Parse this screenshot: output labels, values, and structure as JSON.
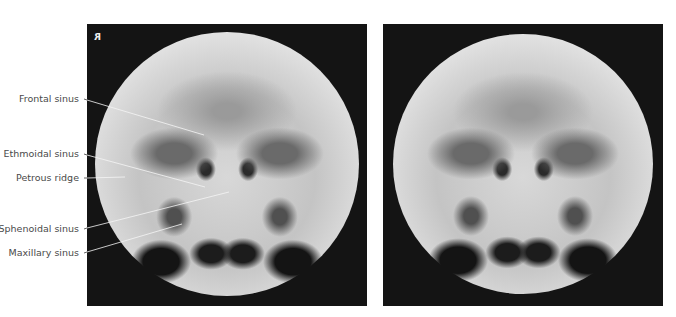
{
  "figure": {
    "left_panel": {
      "orientation_marker": "R",
      "labels": [
        {
          "id": "frontal",
          "text": "Frontal sinus"
        },
        {
          "id": "ethmoidal",
          "text": "Ethmoidal sinus"
        },
        {
          "id": "petrous",
          "text": "Petrous ridge"
        },
        {
          "id": "sphenoidal",
          "text": "Sphenoidal sinus"
        },
        {
          "id": "maxillary",
          "text": "Maxillary sinus"
        }
      ]
    },
    "right_panel": {
      "description": "Unlabeled radiograph (same view)"
    }
  },
  "colors": {
    "panel_background": "#141414",
    "label_text": "#4a4a4a",
    "leader_line_outside": "#3a3a3a",
    "leader_line_inside": "#f5f5f5"
  }
}
